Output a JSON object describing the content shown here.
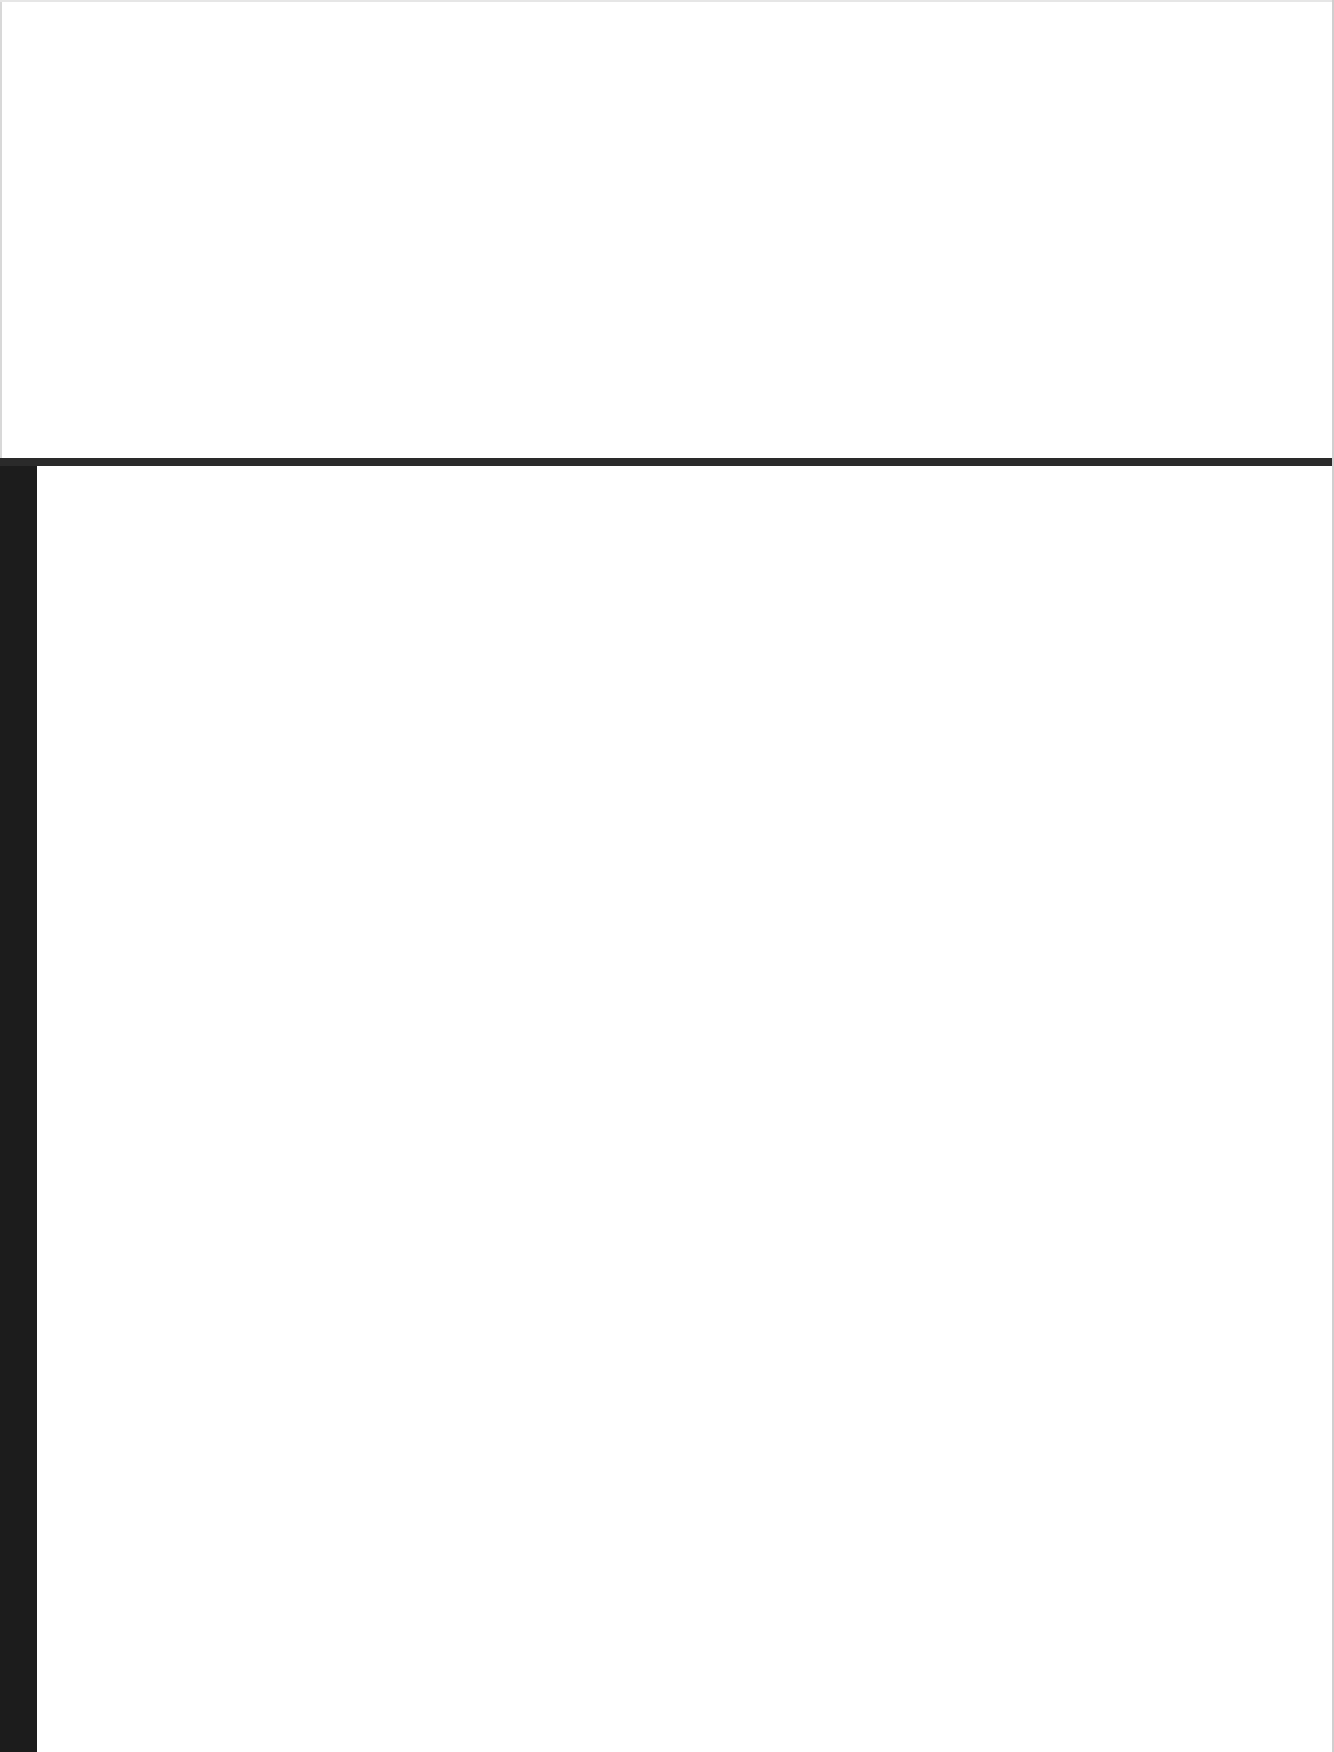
{
  "screen": {
    "top_pane": {
      "content": ""
    },
    "bottom_pane": {
      "content": ""
    }
  },
  "colors": {
    "background": "#ffffff",
    "divider": "#2a2a2a",
    "left_strip": "#1c1c1c"
  }
}
